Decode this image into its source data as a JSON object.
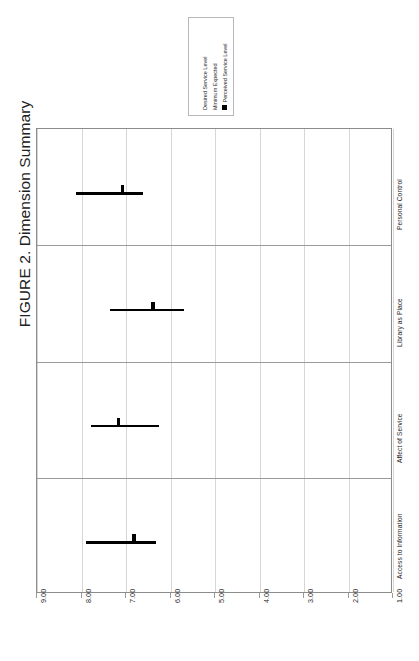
{
  "figure": {
    "title": "FIGURE 2. Dimension Summary"
  },
  "legend": {
    "entries": [
      {
        "label": "Desired Service Level",
        "swatch": false,
        "color": "#000000"
      },
      {
        "label": "Minimum Expected",
        "swatch": false,
        "color": "#000000"
      },
      {
        "label": "Perceived Service Level",
        "swatch": true,
        "color": "#000000"
      }
    ]
  },
  "chart_data": {
    "type": "bar",
    "title": "FIGURE 2. Dimension Summary",
    "xlabel": "",
    "ylabel": "",
    "orientation": "horizontal",
    "xlim": [
      9.0,
      1.0
    ],
    "axis_reversed": true,
    "grid": true,
    "legend_position": "top-center",
    "tick_labels": [
      "9.00",
      "8.00",
      "7.00",
      "6.00",
      "5.00",
      "4.00",
      "3.00",
      "2.00",
      "1.00"
    ],
    "tick_values": [
      9.0,
      8.0,
      7.0,
      6.0,
      5.0,
      4.0,
      3.0,
      2.0,
      1.0
    ],
    "categories": [
      "Access to Information",
      "Affect of Service",
      "Library as Place",
      "Personal Control"
    ],
    "series": [
      {
        "name": "Desired Service Level",
        "values": [
          7.89,
          7.78,
          7.37,
          8.12
        ]
      },
      {
        "name": "Minimum Expected",
        "values": [
          6.32,
          6.26,
          5.69,
          6.62
        ]
      },
      {
        "name": "Perceived Service Level",
        "values": [
          6.82,
          7.17,
          6.39,
          7.08
        ]
      }
    ],
    "panels": [
      {
        "category": "Personal Control",
        "desired_service_level": 8.12,
        "minimum_expected": 6.62,
        "perceived_service_level": 7.08
      },
      {
        "category": "Library as Place",
        "desired_service_level": 7.37,
        "minimum_expected": 5.69,
        "perceived_service_level": 6.39
      },
      {
        "category": "Affect of Service",
        "desired_service_level": 7.78,
        "minimum_expected": 6.26,
        "perceived_service_level": 7.17
      },
      {
        "category": "Access to Information",
        "desired_service_level": 7.89,
        "minimum_expected": 6.32,
        "perceived_service_level": 6.82
      }
    ]
  },
  "colors": {
    "mark": "#000000",
    "grid": "#d6d6d6",
    "panel_border": "#8c8c8c",
    "panel_separator": "#9a9a9a",
    "background": "#ffffff",
    "text": "#262626"
  }
}
